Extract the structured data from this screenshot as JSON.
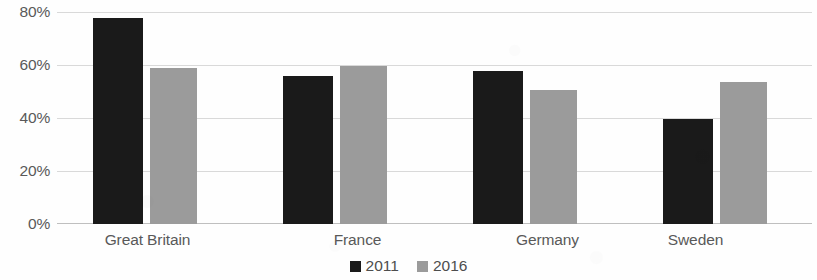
{
  "chart_data": {
    "type": "bar",
    "title": "",
    "subtitle": "",
    "xlabel": "",
    "ylabel": "",
    "categories": [
      "Great Britain",
      "France",
      "Germany",
      "Sweden"
    ],
    "series": [
      {
        "name": "2011",
        "color": "#1a1a1a",
        "values": [
          78,
          56,
          58,
          40
        ]
      },
      {
        "name": "2016",
        "color": "#9b9b9b",
        "values": [
          59,
          60,
          51,
          54
        ]
      }
    ],
    "ylim": [
      0,
      80
    ],
    "ytick_values": [
      0,
      20,
      40,
      60,
      80
    ],
    "ytick_labels": [
      "0%",
      "20%",
      "40%",
      "60%",
      "80%"
    ],
    "grid": true,
    "grid_axis": "y",
    "legend_position": "bottom-center",
    "value_format": "percent"
  },
  "axis": {
    "y_labels": [
      "80%",
      "60%",
      "40%",
      "20%",
      "0%"
    ]
  },
  "legend": {
    "items": [
      {
        "label": "2011",
        "swatch": "black-square-icon"
      },
      {
        "label": "2016",
        "swatch": "gray-square-icon"
      }
    ]
  }
}
